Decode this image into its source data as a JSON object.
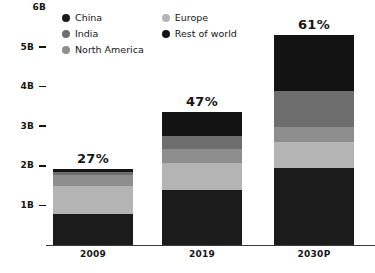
{
  "chart_data": {
    "type": "bar",
    "subtype": "stacked-bar",
    "title": "",
    "xlabel": "",
    "ylabel": "",
    "categories": [
      "2009",
      "2019",
      "2030P"
    ],
    "ylim": [
      0,
      6
    ],
    "yticks": [
      "1B",
      "2B",
      "3B",
      "4B",
      "5B",
      "6B"
    ],
    "ytick_values": [
      1,
      2,
      3,
      4,
      5,
      6
    ],
    "grid": false,
    "legend_position": "top-left",
    "series": [
      {
        "name": "China",
        "color": "#1b1b1b",
        "values": [
          0.78,
          1.4,
          1.95
        ]
      },
      {
        "name": "Europe",
        "color": "#b4b4b4",
        "values": [
          0.72,
          0.66,
          0.65
        ]
      },
      {
        "name": "North America",
        "color": "#8e8e8e",
        "values": [
          0.28,
          0.36,
          0.38
        ]
      },
      {
        "name": "India",
        "color": "#6e6e6e",
        "values": [
          0.07,
          0.33,
          0.92
        ]
      },
      {
        "name": "Rest of world",
        "color": "#131313",
        "values": [
          0.08,
          0.6,
          1.4
        ]
      }
    ],
    "bar_totals": [
      1.93,
      3.35,
      5.3
    ],
    "bar_annotations": [
      "27%",
      "47%",
      "61%"
    ]
  },
  "legend": {
    "columns": [
      [
        {
          "label": "China",
          "color": "#1b1b1b",
          "icon": "legend-dot-icon"
        },
        {
          "label": "India",
          "color": "#6e6e6e",
          "icon": "legend-dot-icon"
        },
        {
          "label": "North America",
          "color": "#8e8e8e",
          "icon": "legend-dot-icon"
        }
      ],
      [
        {
          "label": "Europe",
          "color": "#b4b4b4",
          "icon": "legend-dot-icon"
        },
        {
          "label": "Rest of world",
          "color": "#131313",
          "icon": "legend-dot-icon"
        }
      ]
    ]
  },
  "axis": {
    "y_ticks": [
      {
        "label": "6B",
        "value": 6
      },
      {
        "label": "5B",
        "value": 5
      },
      {
        "label": "4B",
        "value": 4
      },
      {
        "label": "3B",
        "value": 3
      },
      {
        "label": "2B",
        "value": 2
      },
      {
        "label": "1B",
        "value": 1
      }
    ],
    "x_labels": [
      "2009",
      "2019",
      "2030P"
    ]
  },
  "colors": {
    "background": "#ffffff",
    "text": "#161616",
    "baseline": "#3b3b3b"
  }
}
